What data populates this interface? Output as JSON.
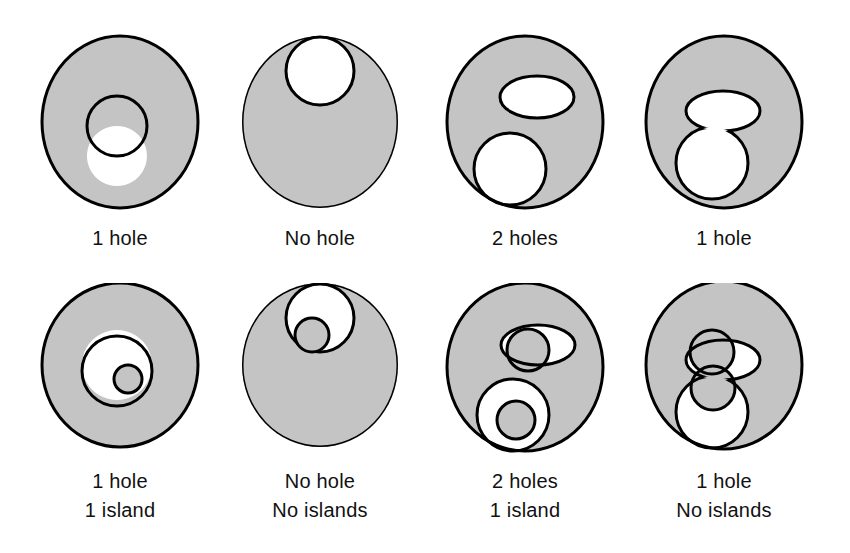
{
  "figure": {
    "background_color": "#ffffff",
    "fill_color": "#c4c4c4",
    "stroke_color": "#000000",
    "hole_color": "#ffffff",
    "text_color": "#111111"
  },
  "rows": [
    {
      "name": "top-row",
      "cells": [
        {
          "name": "disk-with-one-hole",
          "caption_lines": [
            "1 hole"
          ],
          "holes": 1,
          "islands": null
        },
        {
          "name": "disk-with-bay-no-hole",
          "caption_lines": [
            "No hole"
          ],
          "holes": 0,
          "islands": null
        },
        {
          "name": "disk-with-two-holes",
          "caption_lines": [
            "2 holes"
          ],
          "holes": 2,
          "islands": null
        },
        {
          "name": "disk-with-merged-hole",
          "caption_lines": [
            "1 hole"
          ],
          "holes": 1,
          "islands": null
        }
      ]
    },
    {
      "name": "bottom-row",
      "cells": [
        {
          "name": "disk-hole-with-island",
          "caption_lines": [
            "1 hole",
            "1 island"
          ],
          "holes": 1,
          "islands": 1
        },
        {
          "name": "disk-bay-with-peninsula",
          "caption_lines": [
            "No hole",
            "No islands"
          ],
          "holes": 0,
          "islands": 0
        },
        {
          "name": "disk-two-holes-one-island",
          "caption_lines": [
            "2 holes",
            "1 island"
          ],
          "holes": 2,
          "islands": 1
        },
        {
          "name": "disk-merged-hole-peninsula",
          "caption_lines": [
            "1 hole",
            "No islands"
          ],
          "holes": 1,
          "islands": 0
        }
      ]
    }
  ]
}
